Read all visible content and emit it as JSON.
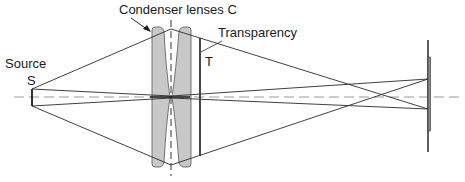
{
  "diagram": {
    "labels": {
      "source_line1": "Source",
      "source_line2": "S",
      "condenser": "Condenser lenses C",
      "transparency": "Transparency",
      "transparency_symbol": "T"
    },
    "colors": {
      "line": "#2a2a2a",
      "lens_fill": "#c8c8c8",
      "axis": "#9a9a9a",
      "background": "#ffffff"
    },
    "components": [
      {
        "id": "source",
        "name": "Source S"
      },
      {
        "id": "condenser-lens-1",
        "name": "Condenser lens (left)"
      },
      {
        "id": "condenser-lens-2",
        "name": "Condenser lens (right)"
      },
      {
        "id": "transparency",
        "name": "Transparency T"
      },
      {
        "id": "screen",
        "name": "Screen"
      }
    ]
  }
}
